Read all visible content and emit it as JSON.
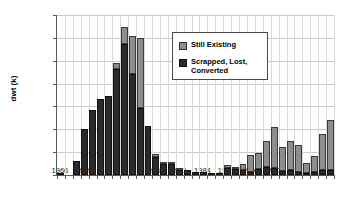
{
  "chart_data": {
    "type": "bar",
    "stacked": true,
    "title": "",
    "subtitle": "",
    "xlabel": "",
    "ylabel": "dwt (k)",
    "ylim": [
      0,
      35000
    ],
    "ytick_labels": [
      "0",
      "5,000",
      "10,000",
      "15,000",
      "20,000",
      "25,000",
      "30,000",
      "35,000"
    ],
    "ytick_values": [
      0,
      5000,
      10000,
      15000,
      20000,
      25000,
      30000,
      35000
    ],
    "xtick_labels": [
      "1966",
      "1969",
      "1972",
      "1975",
      "1978",
      "1981",
      "1984",
      "1987",
      "1990",
      "1993",
      "1996",
      "1999"
    ],
    "grid": "horizontal-and-vertical",
    "legend_position": "inside-upper-right",
    "categories": [
      "1966",
      "1967",
      "1968",
      "1969",
      "1970",
      "1971",
      "1972",
      "1973",
      "1974",
      "1975",
      "1976",
      "1977",
      "1978",
      "1979",
      "1980",
      "1981",
      "1982",
      "1983",
      "1984",
      "1985",
      "1986",
      "1987",
      "1988",
      "1989",
      "1990",
      "1991",
      "1992",
      "1993",
      "1994",
      "1995",
      "1996",
      "1997",
      "1998",
      "1999",
      "2000"
    ],
    "series": [
      {
        "name": "Scrapped, Lost, Converted",
        "color": "#2a2a2a",
        "values": [
          150,
          0,
          3100,
          10000,
          14300,
          16600,
          17300,
          23200,
          28700,
          22100,
          14700,
          10800,
          3900,
          2400,
          2400,
          1100,
          1200,
          600,
          650,
          100,
          400,
          1500,
          1400,
          1000,
          600,
          1400,
          1700,
          1600,
          800,
          1000,
          600,
          400,
          700,
          1000,
          1200
        ]
      },
      {
        "name": "Still Existing",
        "color": "#8d8d8d",
        "values": [
          0,
          0,
          0,
          0,
          0,
          0,
          0,
          1200,
          3600,
          8400,
          15200,
          0,
          800,
          250,
          100,
          50,
          0,
          0,
          0,
          0,
          0,
          800,
          100,
          1500,
          3800,
          3400,
          5800,
          8800,
          5400,
          6400,
          6000,
          2200,
          3500,
          8000,
          10800
        ]
      }
    ],
    "totals": [
      150,
      0,
      3100,
      10000,
      14300,
      16600,
      17300,
      24400,
      32300,
      30500,
      29900,
      10800,
      4700,
      2650,
      2500,
      1150,
      1200,
      600,
      650,
      100,
      400,
      2300,
      1500,
      2500,
      4400,
      4800,
      7500,
      10400,
      6200,
      7400,
      6600,
      2600,
      4200,
      9000,
      12000
    ]
  },
  "legend": {
    "items": [
      {
        "label": "Still Existing"
      },
      {
        "label": "Scrapped, Lost,\nConverted"
      }
    ]
  }
}
